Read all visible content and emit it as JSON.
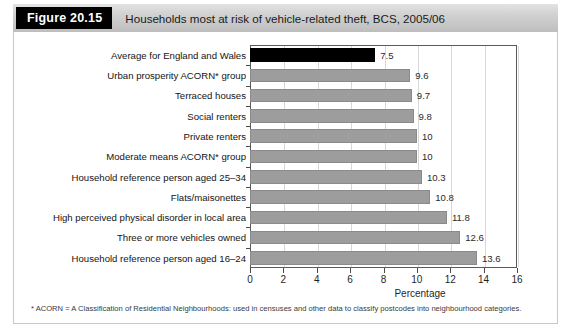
{
  "figure": {
    "tag": "Figure 20.15",
    "title": "Households most at risk of vehicle-related theft, BCS, 2005/06",
    "footnote": "* ACORN = A Classification of Residential Neighbourhoods: used in censuses and other data to classify postcodes into neighbourhood categories."
  },
  "colors": {
    "bar": "#9d9d9d",
    "highlight_bar": "#000000",
    "header_band": "#d2d2d2",
    "tag_background": "#000000",
    "grid": "#d8d8d8",
    "axis": "#5a5a5a"
  },
  "chart_data": {
    "type": "bar",
    "orientation": "horizontal",
    "title": "Households most at risk of vehicle-related theft, BCS, 2005/06",
    "xlabel": "Percentage",
    "ylabel": "",
    "xlim": [
      0,
      16
    ],
    "xticks": [
      0,
      2,
      4,
      6,
      8,
      10,
      12,
      14,
      16
    ],
    "grid": true,
    "legend": false,
    "categories": [
      "Average for England and Wales",
      "Urban prosperity ACORN* group",
      "Terraced houses",
      "Social renters",
      "Private renters",
      "Moderate means ACORN* group",
      "Household reference person aged 25–34",
      "Flats/maisonettes",
      "High perceived physical disorder in local area",
      "Three or more vehicles owned",
      "Household reference person aged 16–24"
    ],
    "values": [
      7.5,
      9.6,
      9.7,
      9.8,
      10,
      10,
      10.3,
      10.8,
      11.8,
      12.6,
      13.6
    ],
    "value_labels": [
      "7.5",
      "9.6",
      "9.7",
      "9.8",
      "10",
      "10",
      "10.3",
      "10.8",
      "11.8",
      "12.6",
      "13.6"
    ],
    "highlight_index": 0
  }
}
